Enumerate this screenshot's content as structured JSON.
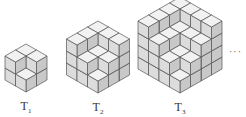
{
  "figure": {
    "caption_top_cut": "",
    "shapes": [
      {
        "id": "T1",
        "label": "T",
        "subscript": "1",
        "n": 1,
        "cx": 26,
        "base_y": 92,
        "label_x": 26,
        "label_y": 99
      },
      {
        "id": "T2",
        "label": "T",
        "subscript": "2",
        "n": 2,
        "cx": 98,
        "base_y": 93,
        "label_x": 98,
        "label_y": 100
      },
      {
        "id": "T3",
        "label": "T",
        "subscript": "3",
        "n": 3,
        "cx": 180,
        "base_y": 93,
        "label_x": 180,
        "label_y": 100
      }
    ],
    "continuation": "···",
    "cube": {
      "half_w": 10.5,
      "half_h": 6,
      "edge": 12
    },
    "colors": {
      "top": "#f2f2f2",
      "left": "#c8c8c8",
      "right": "#dcdcdc",
      "stroke": "#555555"
    }
  }
}
